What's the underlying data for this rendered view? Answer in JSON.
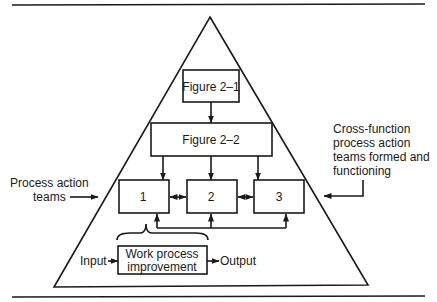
{
  "diagram": {
    "type": "process-improvement-pyramid",
    "nodes": {
      "figure_2_1": "Figure 2–1",
      "figure_2_2": "Figure 2–2",
      "team_1": "1",
      "team_2": "2",
      "team_3": "3",
      "work_process_line1": "Work process",
      "work_process_line2": "improvement"
    },
    "flow": {
      "input": "Input",
      "output": "Output"
    },
    "annotations": {
      "left": [
        "Process action",
        "teams"
      ],
      "right": [
        "Cross-function",
        "process action",
        "teams formed and",
        "functioning"
      ]
    },
    "edges": [
      {
        "from": "Figure 2–1",
        "to": "Figure 2–2"
      },
      {
        "from": "Figure 2–2",
        "to": "1"
      },
      {
        "from": "Figure 2–2",
        "to": "2"
      },
      {
        "from": "Figure 2–2",
        "to": "3"
      },
      {
        "from": "1",
        "to": "2",
        "bidirectional": true
      },
      {
        "from": "2",
        "to": "3",
        "bidirectional": true
      },
      {
        "from": "feedback",
        "to": "1"
      },
      {
        "from": "feedback",
        "to": "2"
      },
      {
        "from": "feedback",
        "to": "3"
      },
      {
        "from": "Input",
        "to": "Work process improvement"
      },
      {
        "from": "Work process improvement",
        "to": "Output"
      }
    ]
  }
}
